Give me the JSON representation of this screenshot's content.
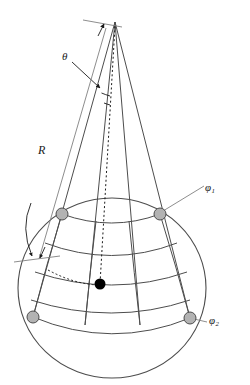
{
  "figure": {
    "background_color": "#ffffff"
  },
  "labels": {
    "theta": "θ",
    "radius": "R",
    "phi1": "φ",
    "phi1_sub": "1",
    "phi2": "φ",
    "phi2_sub": "2"
  },
  "colors": {
    "stroke": "#4d4d4d",
    "stroke_dark": "#333333",
    "node_fill": "#b3b3b3",
    "node_stroke": "#4d4d4d",
    "point_fill": "#000000",
    "leader": "#808080",
    "text": "#1a1a1a"
  },
  "geometry": {
    "apex": {
      "x": 115,
      "y": 22
    },
    "sphere": {
      "cx": 112,
      "cy": 288,
      "rx": 94,
      "ry": 90
    },
    "nodes": [
      {
        "name": "node-top-left",
        "x": 62,
        "y": 214,
        "r": 6
      },
      {
        "name": "node-top-right",
        "x": 160,
        "y": 214,
        "r": 6
      },
      {
        "name": "node-bottom-left",
        "x": 33,
        "y": 317,
        "r": 6
      },
      {
        "name": "node-bottom-right",
        "x": 190,
        "y": 318,
        "r": 6
      }
    ],
    "point_marker": {
      "name": "source-point",
      "x": 100,
      "y": 284,
      "r": 5.5
    },
    "cone_edges": 4,
    "latitude_lines": 5,
    "longitude_lines": 4
  }
}
